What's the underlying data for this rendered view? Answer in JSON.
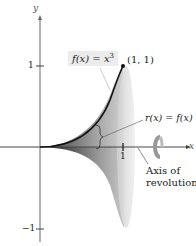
{
  "figure": {
    "axis_labels": {
      "x": "x",
      "y": "y"
    },
    "ticks": {
      "y_pos": "1",
      "y_neg": "−1",
      "x_pos": "1"
    },
    "function_label": "f(x) = x",
    "function_exponent": "3",
    "point_label": "(1, 1)",
    "radius_label": "r(x) = f(x)",
    "axis_of_revolution_label_line1": "Axis of",
    "axis_of_revolution_label_line2": "revolution",
    "colors": {
      "curve": "#111111",
      "solid_dark": "#2a2a2a",
      "solid_light": "#d9d9d9",
      "axes": "#555555",
      "label_box": "#ececec"
    }
  }
}
